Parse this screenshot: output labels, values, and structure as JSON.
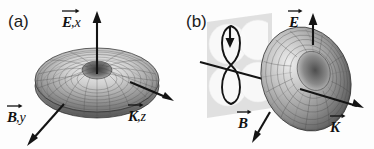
{
  "figure": {
    "background_color": "#fdfdfd",
    "ink_color": "#141414",
    "width": 374,
    "height": 149
  },
  "panels": [
    {
      "id": "a",
      "label": "(a)",
      "object": "torus-wireframe",
      "view": "top-down tilted view of torus, central hole visible",
      "axes": [
        {
          "name": "E-axis",
          "letter": "E",
          "subscript": ",x",
          "direction": "up",
          "label_text": "E,x"
        },
        {
          "name": "B-axis",
          "letter": "B",
          "subscript": ",y",
          "direction": "down-left",
          "label_text": "B,y"
        },
        {
          "name": "K-axis",
          "letter": "K",
          "subscript": ",z",
          "direction": "down-right",
          "label_text": "K,z"
        }
      ]
    },
    {
      "id": "b",
      "label": "(b)",
      "object": "torus-wireframe",
      "view": "tilted side view of torus with dipole radiation pattern plane behind",
      "overlay": {
        "name": "dipole-pattern",
        "shape": "figure-eight",
        "plane_color": "#dcdcdc",
        "lobe_color": "#fafafa",
        "arrow_direction": "down"
      },
      "axes": [
        {
          "name": "E-axis",
          "letter": "E",
          "subscript": "",
          "direction": "up",
          "label_text": "E"
        },
        {
          "name": "B-axis",
          "letter": "B",
          "subscript": "",
          "direction": "down-left",
          "label_text": "B"
        },
        {
          "name": "K-axis",
          "letter": "K",
          "subscript": "",
          "direction": "down-right",
          "label_text": "K"
        }
      ]
    }
  ],
  "labels": {
    "panel_a": "(a)",
    "panel_b": "(b)",
    "a_E": "E",
    "a_E_sub": ",x",
    "a_B": "B",
    "a_B_sub": ",y",
    "a_K": "K",
    "a_K_sub": ",z",
    "b_E": "E",
    "b_B": "B",
    "b_K": "K"
  }
}
